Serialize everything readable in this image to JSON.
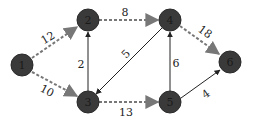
{
  "diagram": {
    "type": "directed-weighted-graph",
    "nodes": [
      {
        "id": "1",
        "label": "1",
        "x": 22,
        "y": 65
      },
      {
        "id": "2",
        "label": "2",
        "x": 88,
        "y": 20
      },
      {
        "id": "3",
        "label": "3",
        "x": 88,
        "y": 102
      },
      {
        "id": "4",
        "label": "4",
        "x": 170,
        "y": 20
      },
      {
        "id": "5",
        "label": "5",
        "x": 170,
        "y": 102
      },
      {
        "id": "6",
        "label": "6",
        "x": 230,
        "y": 62
      }
    ],
    "edges": [
      {
        "from": "1",
        "to": "2",
        "weight": "12",
        "style": "dashed"
      },
      {
        "from": "1",
        "to": "3",
        "weight": "10",
        "style": "dashed"
      },
      {
        "from": "2",
        "to": "4",
        "weight": "8",
        "style": "dashed"
      },
      {
        "from": "3",
        "to": "2",
        "weight": "2",
        "style": "solid"
      },
      {
        "from": "4",
        "to": "3",
        "weight": "5",
        "style": "solid"
      },
      {
        "from": "3",
        "to": "5",
        "weight": "13",
        "style": "dashed"
      },
      {
        "from": "4",
        "to": "6",
        "weight": "18",
        "style": "dashed"
      },
      {
        "from": "5",
        "to": "4",
        "weight": "6",
        "style": "solid"
      },
      {
        "from": "5",
        "to": "6",
        "weight": "4",
        "style": "solid"
      }
    ],
    "colors": {
      "node_fill": "#3a3a3a",
      "dashed_edge": "#777777",
      "solid_edge": "#222222"
    }
  }
}
